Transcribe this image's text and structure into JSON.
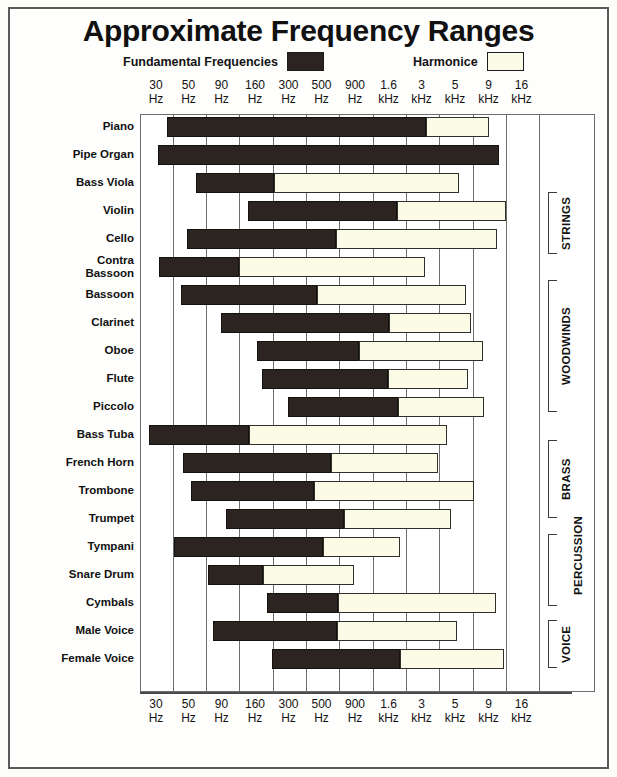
{
  "title": "Approximate Frequency Ranges",
  "legend": {
    "fundamental_label": "Fundamental Frequencies",
    "harmonics_label": "Harmonice",
    "fundamental_color": "#2b2420",
    "harmonics_color": "#fbfbe8"
  },
  "axis": {
    "ticks": [
      {
        "value": "30",
        "unit": "Hz"
      },
      {
        "value": "50",
        "unit": "Hz"
      },
      {
        "value": "90",
        "unit": "Hz"
      },
      {
        "value": "160",
        "unit": "Hz"
      },
      {
        "value": "300",
        "unit": "Hz"
      },
      {
        "value": "500",
        "unit": "Hz"
      },
      {
        "value": "900",
        "unit": "Hz"
      },
      {
        "value": "1.6",
        "unit": "kHz"
      },
      {
        "value": "3",
        "unit": "kHz"
      },
      {
        "value": "5",
        "unit": "kHz"
      },
      {
        "value": "9",
        "unit": "kHz"
      },
      {
        "value": "16",
        "unit": "kHz"
      }
    ]
  },
  "groups": [
    {
      "name": "STRINGS",
      "top": 78,
      "height": 62
    },
    {
      "name": "WOODWINDS",
      "top": 166,
      "height": 132
    },
    {
      "name": "BRASS",
      "top": 326,
      "height": 78
    },
    {
      "name": "PERCUSSION",
      "top": 420,
      "height": 72,
      "label_offset": 40
    },
    {
      "name": "VOICE",
      "top": 506,
      "height": 48
    }
  ],
  "chart_data": {
    "type": "bar",
    "title": "Approximate Frequency Ranges",
    "xlabel": "",
    "ylabel": "",
    "grid": true,
    "legend_position": "top",
    "axis_scale": "log-like categorical",
    "axis_ticks": [
      "30 Hz",
      "50 Hz",
      "90 Hz",
      "160 Hz",
      "300 Hz",
      "500 Hz",
      "900 Hz",
      "1.6 kHz",
      "3 kHz",
      "5 kHz",
      "9 kHz",
      "16 kHz"
    ],
    "series": [
      {
        "name": "Fundamental Frequencies",
        "color": "#2b2420"
      },
      {
        "name": "Harmonice",
        "color": "#fbfbe8"
      }
    ],
    "categories": [
      "Piano",
      "Pipe Organ",
      "Bass Viola",
      "Violin",
      "Cello",
      "Contra\nBassoon",
      "Bassoon",
      "Clarinet",
      "Oboe",
      "Flute",
      "Piccolo",
      "Bass Tuba",
      "French Horn",
      "Trombone",
      "Trumpet",
      "Tympani",
      "Snare Drum",
      "Cymbals",
      "Male Voice",
      "Female Voice"
    ],
    "rows": [
      {
        "label": "Piano",
        "fund_start": 26,
        "fund_end": 285,
        "harm_end": 348,
        "row_top": 2
      },
      {
        "label": "Pipe Organ",
        "fund_start": 17,
        "fund_end": 358,
        "harm_end": 358,
        "row_top": 30
      },
      {
        "label": "Bass Viola",
        "fund_start": 55,
        "fund_end": 133,
        "harm_end": 318,
        "row_top": 58
      },
      {
        "label": "Violin",
        "fund_start": 107,
        "fund_end": 256,
        "harm_end": 365,
        "row_top": 86
      },
      {
        "label": "Cello",
        "fund_start": 46,
        "fund_end": 195,
        "harm_end": 356,
        "row_top": 114
      },
      {
        "label": "Contra\nBassoon",
        "fund_start": 18,
        "fund_end": 98,
        "harm_end": 284,
        "row_top": 142
      },
      {
        "label": "Bassoon",
        "fund_start": 40,
        "fund_end": 176,
        "harm_end": 325,
        "row_top": 170
      },
      {
        "label": "Clarinet",
        "fund_start": 80,
        "fund_end": 248,
        "harm_end": 330,
        "row_top": 198
      },
      {
        "label": "Oboe",
        "fund_start": 116,
        "fund_end": 218,
        "harm_end": 342,
        "row_top": 226
      },
      {
        "label": "Flute",
        "fund_start": 121,
        "fund_end": 247,
        "harm_end": 327,
        "row_top": 254
      },
      {
        "label": "Piccolo",
        "fund_start": 147,
        "fund_end": 257,
        "harm_end": 343,
        "row_top": 282
      },
      {
        "label": "Bass Tuba",
        "fund_start": 8,
        "fund_end": 108,
        "harm_end": 306,
        "row_top": 310
      },
      {
        "label": "French Horn",
        "fund_start": 42,
        "fund_end": 190,
        "harm_end": 297,
        "row_top": 338
      },
      {
        "label": "Trombone",
        "fund_start": 50,
        "fund_end": 173,
        "harm_end": 333,
        "row_top": 366
      },
      {
        "label": "Trumpet",
        "fund_start": 85,
        "fund_end": 203,
        "harm_end": 310,
        "row_top": 394
      },
      {
        "label": "Tympani",
        "fund_start": 33,
        "fund_end": 182,
        "harm_end": 259,
        "row_top": 422
      },
      {
        "label": "Snare Drum",
        "fund_start": 67,
        "fund_end": 122,
        "harm_end": 213,
        "row_top": 450
      },
      {
        "label": "Cymbals",
        "fund_start": 126,
        "fund_end": 197,
        "harm_end": 355,
        "row_top": 478
      },
      {
        "label": "Male Voice",
        "fund_start": 72,
        "fund_end": 196,
        "harm_end": 316,
        "row_top": 506
      },
      {
        "label": "Female Voice",
        "fund_start": 131,
        "fund_end": 259,
        "harm_end": 363,
        "row_top": 534
      }
    ],
    "gridline_positions": [
      32,
      65,
      98,
      132,
      165,
      198,
      232,
      265,
      298,
      332,
      365,
      398
    ]
  }
}
